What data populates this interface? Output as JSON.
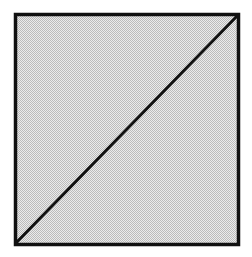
{
  "figure": {
    "name": "square-with-diagonal",
    "caption": "",
    "canvas": {
      "width": 252,
      "height": 257,
      "background_color": "#ffffff"
    },
    "shapes": [
      {
        "id": "outer-square",
        "type": "rectangle",
        "label": "square",
        "x": 15.5,
        "y": 14.5,
        "width": 223,
        "height": 230,
        "stroke_color": "#111111",
        "stroke_width": 3.5,
        "fill_color": "#d2d2d2",
        "fill_texture": "halftone-dither"
      },
      {
        "id": "diagonal-line",
        "type": "line",
        "label": "diagonal",
        "x1": 238,
        "y1": 15,
        "x2": 16,
        "y2": 243,
        "stroke_color": "#111111",
        "stroke_width": 3
      }
    ],
    "regions": [
      {
        "id": "upper-left-triangle",
        "label": "upper-left triangle",
        "fill_color": "#d2d2d2"
      },
      {
        "id": "lower-right-triangle",
        "label": "lower-right triangle",
        "fill_color": "#d2d2d2"
      }
    ],
    "annotations": [],
    "colors": {
      "ink": "#111111",
      "fill": "#d2d2d2",
      "paper": "#ffffff"
    }
  }
}
